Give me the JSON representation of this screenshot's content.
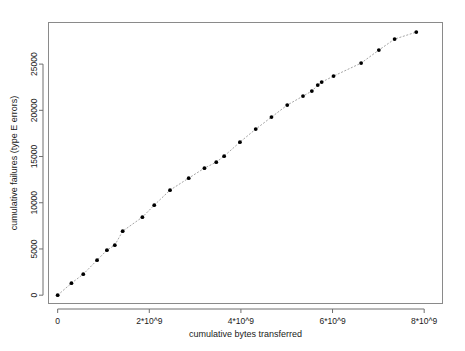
{
  "chart_data": {
    "type": "line",
    "title": "",
    "xlabel": "cumulative bytes transferred",
    "ylabel": "cumulative failures (type E errors)",
    "xlim": [
      -200000000,
      8400000000
    ],
    "ylim": [
      -900,
      29500
    ],
    "grid": false,
    "legend": "none",
    "marker": "filled-circle",
    "linestyle": "dotted",
    "xticks": [
      0,
      2000000000,
      4000000000,
      6000000000,
      8000000000
    ],
    "xtick_labels": [
      "0",
      "2*10^9",
      "4*10^9",
      "6*10^9",
      "8*10^9"
    ],
    "yticks": [
      0,
      5000,
      10000,
      15000,
      20000,
      25000
    ],
    "ytick_labels": [
      "0",
      "5000",
      "10000",
      "15000",
      "20000",
      "25000"
    ],
    "x": [
      0,
      301000000,
      559000000,
      860000000,
      1075000000,
      1247000000,
      1419000000,
      1849000000,
      2108000000,
      2452000000,
      2860000000,
      3204000000,
      3462000000,
      3634000000,
      3978000000,
      4323000000,
      4667000000,
      5011000000,
      5355000000,
      5548000000,
      5677000000,
      5763000000,
      6022000000,
      6624000000,
      7011000000,
      7355000000,
      7828000000
    ],
    "y": [
      0,
      1298,
      2273,
      3788,
      4870,
      5411,
      6926,
      8442,
      9740,
      11364,
      12662,
      13745,
      14394,
      15043,
      16558,
      17965,
      19264,
      20563,
      21537,
      22078,
      22727,
      23051,
      23701,
      25108,
      26515,
      27705,
      28463
    ]
  }
}
